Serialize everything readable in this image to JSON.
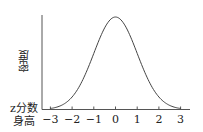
{
  "chart_data": {
    "type": "line",
    "title": "",
    "ylabel": "密度",
    "xlabel_rows": [
      "z分数",
      "身高"
    ],
    "x_ticks": [
      -3,
      -2,
      -1,
      0,
      1,
      2,
      3
    ],
    "x_tick_labels": [
      "−3",
      "−2",
      "−1",
      "0",
      "1",
      "2",
      "3"
    ],
    "xlim": [
      -3.3,
      3.3
    ],
    "series": [
      {
        "name": "standard normal density",
        "function": "exp(-x^2/2)/sqrt(2*pi)",
        "x_range": [
          -3,
          3
        ]
      }
    ],
    "grid": false,
    "legend": null
  },
  "labels": {
    "y_axis": "密度",
    "x_row1": "z分数",
    "x_row2": "身高"
  },
  "colors": {
    "axis": "#555555",
    "curve": "#444444"
  }
}
